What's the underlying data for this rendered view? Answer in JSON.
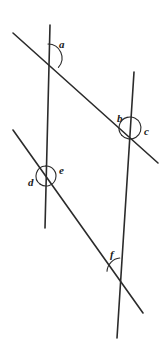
{
  "figure": {
    "background_color": "#ffffff",
    "line_color": "#2b2b2b",
    "arc_color": "#2b2b2b",
    "label_color": "#1a1a1a",
    "line_width": 1.6,
    "arc_width": 1.1,
    "width": 163,
    "height": 352
  },
  "lines": [
    {
      "name": "left-line",
      "description": "near-vertical line on the left",
      "x1": 50,
      "y1": 25,
      "x2": 45,
      "y2": 228
    },
    {
      "name": "right-line",
      "description": "near-vertical line on the right, tilted",
      "x1": 134,
      "y1": 72,
      "x2": 117,
      "y2": 338
    },
    {
      "name": "upper-transversal",
      "description": "upper slanted line from top-left to right",
      "x1": 13,
      "y1": 33,
      "x2": 158,
      "y2": 163
    },
    {
      "name": "lower-transversal",
      "description": "lower slanted line from left to bottom-right",
      "x1": 13,
      "y1": 130,
      "x2": 143,
      "y2": 313
    }
  ],
  "intersections": [
    {
      "name": "upper-left-vertex",
      "x": 48,
      "y": 58
    },
    {
      "name": "upper-right-vertex",
      "x": 130,
      "y": 128
    },
    {
      "name": "lower-left-vertex",
      "x": 46,
      "y": 176
    },
    {
      "name": "lower-right-vertex",
      "x": 121,
      "y": 272
    }
  ],
  "angles": [
    {
      "id": "a",
      "label": "a",
      "vertex": "upper-left-vertex",
      "cx": 48,
      "cy": 58,
      "radius": 14,
      "start_deg": -90,
      "end_deg": 42,
      "label_x": 59,
      "label_y": 39
    },
    {
      "id": "b",
      "label": "b",
      "vertex": "upper-right-vertex",
      "cx": 130,
      "cy": 128,
      "radius": 11,
      "start_deg": 138,
      "end_deg": 255,
      "label_x": 117,
      "label_y": 113
    },
    {
      "id": "c",
      "label": "c",
      "vertex": "upper-right-vertex",
      "cx": 130,
      "cy": 128,
      "radius": 11,
      "start_deg": -105,
      "end_deg": 138,
      "label_x": 144,
      "label_y": 126
    },
    {
      "id": "d",
      "label": "d",
      "vertex": "lower-left-vertex",
      "cx": 46,
      "cy": 176,
      "radius": 10,
      "start_deg": 125,
      "end_deg": 268,
      "label_x": 28,
      "label_y": 177
    },
    {
      "id": "e",
      "label": "e",
      "vertex": "lower-left-vertex",
      "cx": 46,
      "cy": 176,
      "radius": 10,
      "start_deg": -92,
      "end_deg": 125,
      "label_x": 59,
      "label_y": 165
    },
    {
      "id": "f",
      "label": "f",
      "vertex": "lower-right-vertex",
      "cx": 121,
      "cy": 272,
      "radius": 14,
      "start_deg": 183,
      "end_deg": 265,
      "label_x": 110,
      "label_y": 249
    }
  ]
}
